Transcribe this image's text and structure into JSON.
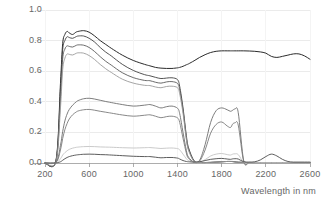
{
  "chart_data": {
    "type": "line",
    "title": "",
    "subtitle": "",
    "xlabel": "Wavelength in nm",
    "ylabel": "",
    "xlim": [
      200,
      2600
    ],
    "ylim": [
      0.0,
      1.0
    ],
    "grid": true,
    "grid_axis": "y",
    "legend": "none",
    "xticks": [
      200,
      600,
      1000,
      1400,
      1800,
      2200,
      2600
    ],
    "xtick_labels": [
      "200",
      "600",
      "1000",
      "1400",
      "1800",
      "2200",
      "2600"
    ],
    "yticks": [
      0.0,
      0.2,
      0.4,
      0.6,
      0.8,
      1.0
    ],
    "ytick_labels": [
      "0.0",
      "0.2",
      "0.4",
      "0.6",
      "0.8",
      "1.0"
    ],
    "x": [
      200,
      300,
      340,
      360,
      380,
      400,
      420,
      450,
      480,
      500,
      550,
      600,
      650,
      700,
      750,
      800,
      900,
      1000,
      1100,
      1150,
      1200,
      1250,
      1300,
      1350,
      1400,
      1420,
      1450,
      1480,
      1500,
      1550,
      1600,
      1650,
      1700,
      1750,
      1800,
      1850,
      1880,
      1900,
      1920,
      1950,
      2000,
      2050,
      2100,
      2150,
      2200,
      2250,
      2300,
      2350,
      2400,
      2450,
      2500,
      2550,
      2600
    ],
    "series": [
      {
        "name": "spectrum-1-bright-broadband",
        "color": "#2b2b2b",
        "width": 1.0,
        "values": [
          0.0,
          0.02,
          0.52,
          0.78,
          0.84,
          0.86,
          0.85,
          0.84,
          0.855,
          0.86,
          0.865,
          0.855,
          0.83,
          0.8,
          0.775,
          0.75,
          0.705,
          0.67,
          0.645,
          0.635,
          0.625,
          0.62,
          0.618,
          0.618,
          0.622,
          0.625,
          0.632,
          0.642,
          0.648,
          0.668,
          0.69,
          0.708,
          0.722,
          0.73,
          0.733,
          0.733,
          0.733,
          0.733,
          0.733,
          0.733,
          0.733,
          0.732,
          0.73,
          0.726,
          0.718,
          0.697,
          0.69,
          0.697,
          0.705,
          0.713,
          0.713,
          0.7,
          0.678
        ]
      },
      {
        "name": "spectrum-2-high-water-absorbing",
        "color": "#3f3f3f",
        "width": 0.9,
        "values": [
          0.0,
          0.015,
          0.48,
          0.74,
          0.8,
          0.825,
          0.82,
          0.815,
          0.825,
          0.83,
          0.83,
          0.815,
          0.79,
          0.755,
          0.725,
          0.7,
          0.645,
          0.605,
          0.578,
          0.57,
          0.56,
          0.552,
          0.555,
          0.557,
          0.545,
          0.5,
          0.36,
          0.18,
          0.1,
          0.015,
          0.005,
          0.003,
          0.004,
          0.006,
          0.008,
          0.01,
          0.01,
          0.01,
          0.008,
          0.005,
          0.004,
          0.003,
          0.003,
          0.003,
          0.003,
          0.003,
          0.003,
          0.003,
          0.003,
          0.003,
          0.003,
          0.003,
          0.003
        ]
      },
      {
        "name": "spectrum-3-mid-bright",
        "color": "#5a5a5a",
        "width": 0.9,
        "values": [
          0.0,
          0.012,
          0.42,
          0.68,
          0.745,
          0.765,
          0.762,
          0.758,
          0.768,
          0.772,
          0.77,
          0.755,
          0.728,
          0.695,
          0.665,
          0.64,
          0.59,
          0.558,
          0.54,
          0.538,
          0.528,
          0.522,
          0.53,
          0.532,
          0.52,
          0.478,
          0.345,
          0.165,
          0.09,
          0.012,
          0.004,
          0.003,
          0.004,
          0.006,
          0.008,
          0.01,
          0.01,
          0.009,
          0.007,
          0.005,
          0.004,
          0.003,
          0.003,
          0.003,
          0.003,
          0.003,
          0.003,
          0.003,
          0.003,
          0.003,
          0.003,
          0.003,
          0.003
        ]
      },
      {
        "name": "spectrum-4-light-gray-upper",
        "color": "#9a9a9a",
        "width": 0.9,
        "values": [
          0.0,
          0.01,
          0.36,
          0.61,
          0.685,
          0.712,
          0.71,
          0.706,
          0.716,
          0.72,
          0.718,
          0.702,
          0.676,
          0.644,
          0.616,
          0.592,
          0.548,
          0.522,
          0.508,
          0.506,
          0.497,
          0.492,
          0.5,
          0.502,
          0.492,
          0.452,
          0.325,
          0.155,
          0.082,
          0.01,
          0.004,
          0.003,
          0.004,
          0.006,
          0.008,
          0.01,
          0.01,
          0.009,
          0.007,
          0.005,
          0.004,
          0.003,
          0.003,
          0.003,
          0.003,
          0.003,
          0.003,
          0.003,
          0.003,
          0.003,
          0.003,
          0.003,
          0.003
        ]
      },
      {
        "name": "spectrum-5-mid-reflectance-vegetation-like",
        "color": "#6e6e6e",
        "width": 0.9,
        "values": [
          0.0,
          0.006,
          0.115,
          0.205,
          0.275,
          0.32,
          0.35,
          0.378,
          0.398,
          0.408,
          0.42,
          0.423,
          0.418,
          0.41,
          0.402,
          0.395,
          0.382,
          0.372,
          0.378,
          0.382,
          0.372,
          0.36,
          0.368,
          0.372,
          0.358,
          0.322,
          0.2,
          0.082,
          0.038,
          0.006,
          0.018,
          0.12,
          0.265,
          0.342,
          0.36,
          0.348,
          0.338,
          0.345,
          0.352,
          0.33,
          0.012,
          0.004,
          0.003,
          0.003,
          0.003,
          0.003,
          0.003,
          0.003,
          0.003,
          0.003,
          0.003,
          0.003,
          0.003
        ]
      },
      {
        "name": "spectrum-6-lower-mid-reflectance",
        "color": "#7a7a7a",
        "width": 0.9,
        "values": [
          0.0,
          0.004,
          0.085,
          0.16,
          0.218,
          0.258,
          0.288,
          0.315,
          0.332,
          0.34,
          0.348,
          0.35,
          0.345,
          0.338,
          0.332,
          0.326,
          0.314,
          0.306,
          0.312,
          0.315,
          0.306,
          0.296,
          0.303,
          0.306,
          0.295,
          0.265,
          0.162,
          0.065,
          0.03,
          0.005,
          0.012,
          0.085,
          0.195,
          0.252,
          0.268,
          0.242,
          0.232,
          0.255,
          0.262,
          0.248,
          0.01,
          0.003,
          0.003,
          0.003,
          0.003,
          0.003,
          0.003,
          0.003,
          0.003,
          0.003,
          0.003,
          0.003,
          0.003
        ]
      },
      {
        "name": "spectrum-7-pale-low-reflectance",
        "color": "#c4c4c4",
        "width": 0.9,
        "values": [
          0.0,
          0.002,
          0.028,
          0.052,
          0.068,
          0.08,
          0.089,
          0.097,
          0.102,
          0.104,
          0.107,
          0.108,
          0.107,
          0.105,
          0.104,
          0.103,
          0.1,
          0.098,
          0.1,
          0.101,
          0.098,
          0.095,
          0.097,
          0.098,
          0.094,
          0.086,
          0.058,
          0.028,
          0.016,
          0.004,
          0.006,
          0.022,
          0.046,
          0.058,
          0.062,
          0.055,
          0.052,
          0.058,
          0.06,
          0.055,
          0.004,
          0.002,
          0.002,
          0.002,
          0.002,
          0.002,
          0.002,
          0.002,
          0.002,
          0.002,
          0.002,
          0.002,
          0.002
        ]
      },
      {
        "name": "spectrum-8-low-gray-with-2250-bump",
        "color": "#4a4a4a",
        "width": 0.9,
        "values": [
          0.0,
          0.001,
          0.008,
          0.018,
          0.028,
          0.036,
          0.042,
          0.048,
          0.052,
          0.054,
          0.057,
          0.058,
          0.057,
          0.055,
          0.054,
          0.052,
          0.048,
          0.044,
          0.042,
          0.042,
          0.038,
          0.034,
          0.036,
          0.036,
          0.032,
          0.026,
          0.016,
          0.01,
          0.008,
          0.006,
          0.008,
          0.016,
          0.024,
          0.028,
          0.03,
          0.026,
          0.024,
          0.027,
          0.028,
          0.026,
          0.008,
          0.006,
          0.008,
          0.02,
          0.042,
          0.058,
          0.046,
          0.024,
          0.01,
          0.006,
          0.006,
          0.006,
          0.006
        ]
      }
    ]
  },
  "axes": {
    "y_label_top": "1.0",
    "x_axis_title": "Wavelength in nm"
  },
  "style": {
    "grid_color": "#ebebeb",
    "axis_color": "#999999",
    "tick_text_color": "#666666",
    "background": "#ffffff"
  }
}
